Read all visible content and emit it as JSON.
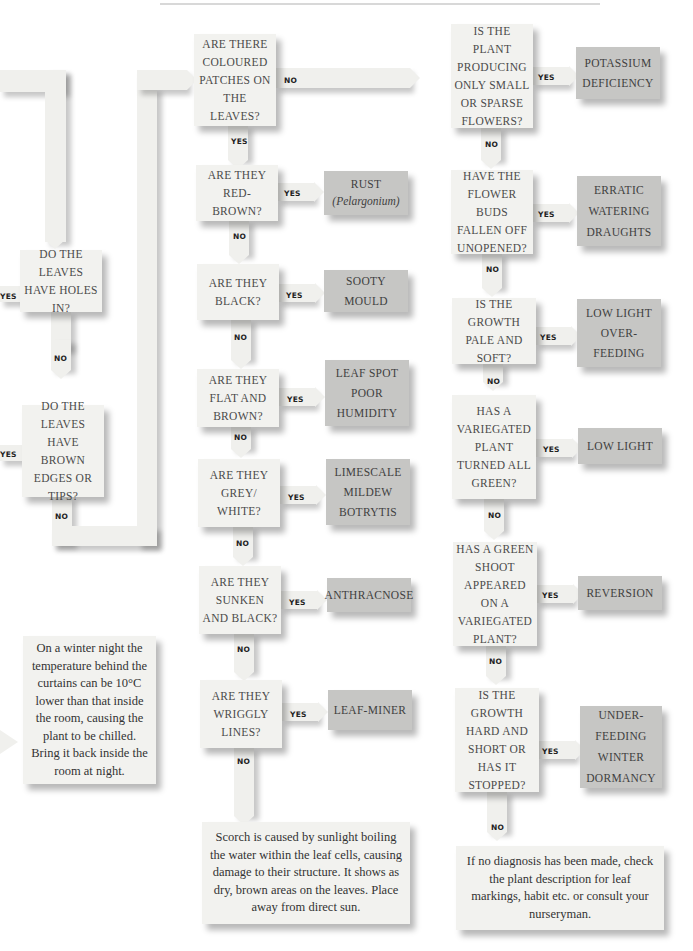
{
  "flowchart": {
    "left_column": {
      "q_holes": {
        "text": "DO THE LEAVES HAVE HOLES IN?",
        "yes": "YES",
        "no": "NO"
      },
      "q_brown_edges": {
        "text": "DO THE LEAVES HAVE BROWN EDGES OR TIPS?",
        "yes": "YES",
        "no": "NO"
      },
      "note_chill": "On a winter night the temperature behind the curtains can be 10°C lower than that inside the room, causing the plant to be chilled. Bring it back inside the room at night."
    },
    "middle_column": {
      "q_patches": {
        "text": "ARE THERE COLOURED PATCHES ON THE LEAVES?",
        "yes": "YES",
        "no": "NO"
      },
      "q_red_brown": {
        "text": "ARE THEY RED-BROWN?",
        "yes": "YES",
        "no": "NO",
        "result_line1": "RUST",
        "result_line2": "(Pelargonium)"
      },
      "q_black": {
        "text": "ARE THEY BLACK?",
        "yes": "YES",
        "no": "NO",
        "result": "SOOTY MOULD"
      },
      "q_flat_brown": {
        "text": "ARE THEY FLAT AND BROWN?",
        "yes": "YES",
        "no": "NO",
        "result_line1": "LEAF SPOT",
        "result_line2": "POOR",
        "result_line3": "HUMIDITY"
      },
      "q_grey_white": {
        "text": "ARE THEY GREY/ WHITE?",
        "yes": "YES",
        "no": "NO",
        "result_line1": "LIMESCALE",
        "result_line2": "MILDEW",
        "result_line3": "BOTRYTIS"
      },
      "q_sunken": {
        "text": "ARE THEY SUNKEN AND BLACK?",
        "yes": "YES",
        "no": "NO",
        "result": "ANTHRACNOSE"
      },
      "q_wriggly": {
        "text": "ARE THEY WRIGGLY LINES?",
        "yes": "YES",
        "no": "NO",
        "result": "LEAF-MINER"
      },
      "note_scorch": "Scorch is caused by sunlight boiling the water within the leaf cells, causing damage to their structure. It shows as dry, brown areas on the leaves. Place away from direct sun."
    },
    "right_column": {
      "q_flowers": {
        "text": "IS THE PLANT PRODUCING ONLY SMALL OR SPARSE FLOWERS?",
        "yes": "YES",
        "no": "NO",
        "result_line1": "POTASSIUM",
        "result_line2": "DEFICIENCY"
      },
      "q_buds": {
        "text": "HAVE THE FLOWER BUDS FALLEN OFF UNOPENED?",
        "yes": "YES",
        "no": "NO",
        "result_line1": "ERRATIC",
        "result_line2": "WATERING",
        "result_line3": "DRAUGHTS"
      },
      "q_pale": {
        "text": "IS THE GROWTH PALE AND SOFT?",
        "yes": "YES",
        "no": "NO",
        "result_line1": "LOW LIGHT",
        "result_line2": "OVER-FEEDING"
      },
      "q_variegated": {
        "text": "HAS A VARIEGATED PLANT TURNED ALL GREEN?",
        "yes": "YES",
        "no": "NO",
        "result": "LOW LIGHT"
      },
      "q_shoot": {
        "text": "HAS A GREEN SHOOT APPEARED ON A VARIEGATED PLANT?",
        "yes": "YES",
        "no": "NO",
        "result": "REVERSION"
      },
      "q_hard": {
        "text": "IS THE GROWTH HARD AND SHORT OR HAS IT STOPPED?",
        "yes": "YES",
        "no": "NO",
        "result_line1": "UNDER-",
        "result_line2": "FEEDING",
        "result_line3": "WINTER",
        "result_line4": "DORMANCY"
      },
      "note_final": "If no diagnosis has been made, check the plant description for leaf markings, habit etc. or consult your nurseryman."
    }
  }
}
